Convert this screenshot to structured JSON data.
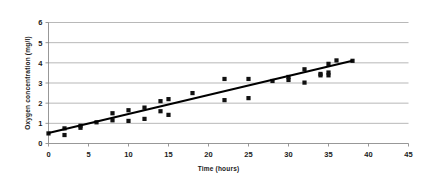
{
  "chart_data": {
    "type": "scatter",
    "title": "",
    "xlabel": "Time (hours)",
    "ylabel": "Oxygen  concentration  (mg/l)",
    "xlim": [
      0,
      45
    ],
    "ylim": [
      0,
      6
    ],
    "xticks": [
      0,
      5,
      10,
      15,
      20,
      25,
      30,
      35,
      40,
      45
    ],
    "yticks": [
      0,
      1,
      2,
      3,
      4,
      5,
      6
    ],
    "grid": "horizontal",
    "legend": "none",
    "marker_color": "#111111",
    "marker_shape": "square",
    "gridline_color": "#9a9a9a",
    "axis_color": "#7d7d7d",
    "series": [
      {
        "name": "Oxygen concentration measurements",
        "points": [
          [
            0,
            0.5
          ],
          [
            2,
            0.75
          ],
          [
            2,
            0.42
          ],
          [
            4,
            0.88
          ],
          [
            4,
            0.78
          ],
          [
            6,
            1.05
          ],
          [
            8,
            1.5
          ],
          [
            8,
            1.15
          ],
          [
            10,
            1.65
          ],
          [
            10,
            1.12
          ],
          [
            12,
            1.78
          ],
          [
            12,
            1.22
          ],
          [
            14,
            2.1
          ],
          [
            14,
            1.6
          ],
          [
            15,
            2.2
          ],
          [
            15,
            1.42
          ],
          [
            18,
            2.5
          ],
          [
            22,
            3.2
          ],
          [
            22,
            2.15
          ],
          [
            25,
            3.2
          ],
          [
            25,
            2.25
          ],
          [
            28,
            3.1
          ],
          [
            30,
            3.3
          ],
          [
            30,
            3.15
          ],
          [
            32,
            3.68
          ],
          [
            32,
            3.02
          ],
          [
            34,
            3.45
          ],
          [
            34,
            3.38
          ],
          [
            35,
            3.95
          ],
          [
            35,
            3.52
          ],
          [
            35,
            3.38
          ],
          [
            36,
            4.12
          ],
          [
            38,
            4.1
          ]
        ]
      }
    ],
    "trendline": {
      "name": "linear fit",
      "x_start": 0,
      "y_start": 0.52,
      "x_end": 38,
      "y_end": 4.1,
      "color": "#000000"
    }
  }
}
